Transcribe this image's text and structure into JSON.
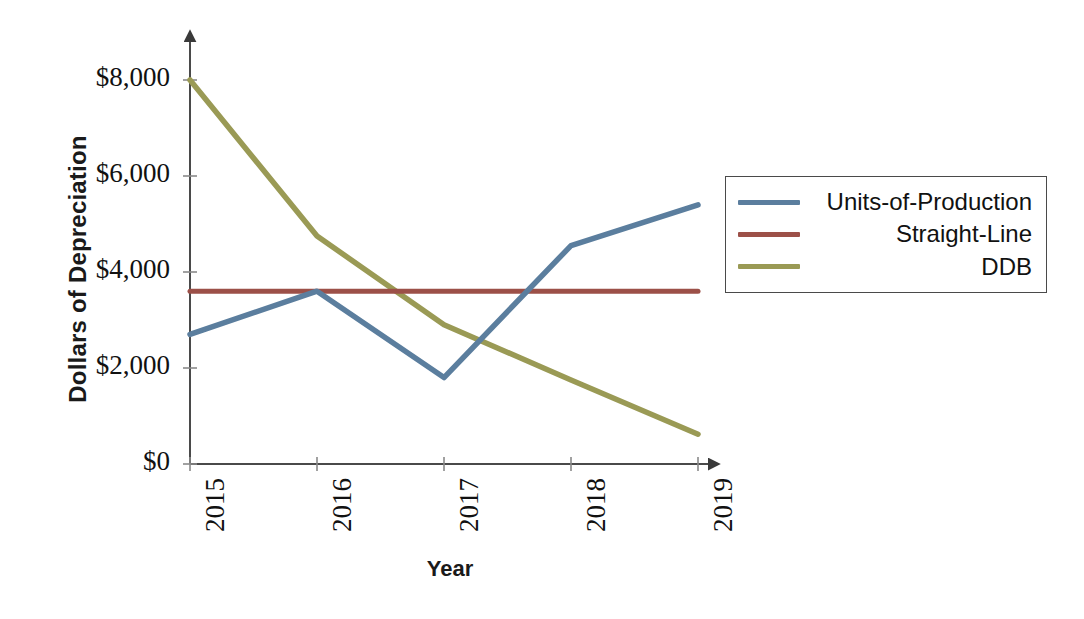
{
  "chart_data": {
    "type": "line",
    "title": "",
    "xlabel": "Year",
    "ylabel": "Dollars of Depreciation",
    "categories": [
      "2015",
      "2016",
      "2017",
      "2018",
      "2019"
    ],
    "ylim": [
      0,
      8000
    ],
    "xlim": [
      2015,
      2019
    ],
    "ytick_labels": [
      "$0",
      "$2,000",
      "$4,000",
      "$6,000",
      "$8,000"
    ],
    "ytick_values": [
      0,
      2000,
      4000,
      6000,
      8000
    ],
    "grid": false,
    "legend_position": "right",
    "axis_arrows": true,
    "series": [
      {
        "name": "Units-of-Production",
        "color": "#5B7E9E",
        "values": [
          2700,
          3600,
          1800,
          4550,
          5400
        ]
      },
      {
        "name": "Straight-Line",
        "color": "#9C5048",
        "values": [
          3600,
          3600,
          3600,
          3600,
          3600
        ]
      },
      {
        "name": "DDB",
        "color": "#9A9A55",
        "values": [
          8000,
          4750,
          2900,
          1750,
          620
        ]
      }
    ]
  },
  "axes": {
    "x_title": "Year",
    "y_title": "Dollars of Depreciation",
    "y_ticks": [
      {
        "label": "$8,000",
        "value": 8000
      },
      {
        "label": "$6,000",
        "value": 6000
      },
      {
        "label": "$4,000",
        "value": 4000
      },
      {
        "label": "$2,000",
        "value": 2000
      },
      {
        "label": "$0",
        "value": 0
      }
    ],
    "x_ticks": [
      {
        "label": "2015"
      },
      {
        "label": "2016"
      },
      {
        "label": "2017"
      },
      {
        "label": "2018"
      },
      {
        "label": "2019"
      }
    ]
  },
  "legend": {
    "items": [
      {
        "label": "Units-of-Production",
        "color": "#5B7E9E"
      },
      {
        "label": "Straight-Line",
        "color": "#9C5048"
      },
      {
        "label": "DDB",
        "color": "#9A9A55"
      }
    ]
  },
  "colors": {
    "units_of_production": "#5B7E9E",
    "straight_line": "#9C5048",
    "ddb": "#9A9A55",
    "axis": "#4a4a4a",
    "text": "#111111",
    "background": "#ffffff"
  }
}
